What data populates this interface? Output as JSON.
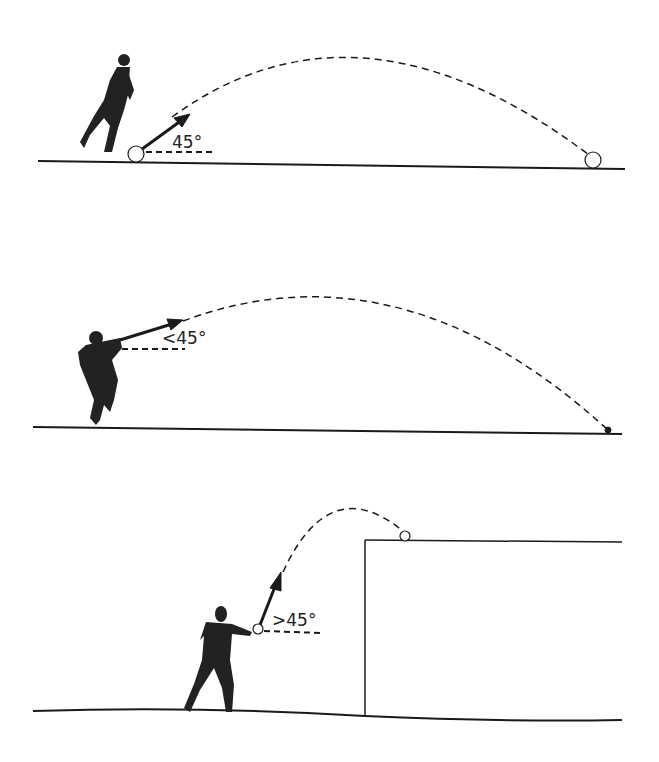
{
  "panels": [
    {
      "id": "kick",
      "angle_label": "45°",
      "description": "Kick at 45 degrees, ball lands far on ground"
    },
    {
      "id": "throw",
      "angle_label": "<45°",
      "description": "Throw at less than 45 degrees, ball lands on ground"
    },
    {
      "id": "lob",
      "angle_label": ">45°",
      "description": "Throw at more than 45 degrees, ball lands on top of a wall"
    }
  ],
  "colors": {
    "ink": "#1a1a1a",
    "background": "#ffffff"
  }
}
